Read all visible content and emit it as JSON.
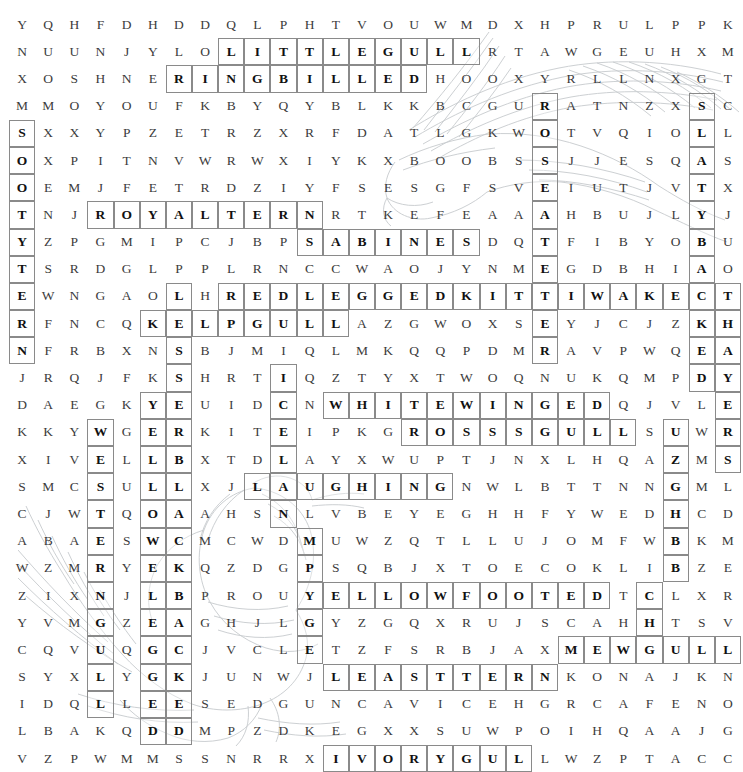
{
  "puzzle": {
    "type": "word-search",
    "theme": "gulls-and-terns",
    "rows": 26,
    "cols": 28,
    "grid": [
      "YQHFDHDDQLPHTVOUWMDXHPRULPPK",
      "NUUNJYLOLITTLEGULLRTAWGEUHXM",
      "XOSHNERINGBILLEDHOOXYRLLNXGT",
      "MMOYOUFKBYQYBLKKBCGURATNZXSC",
      "SXXYPZETRZXRFDATLGKWOTVQIOLL",
      "OXPITNVWRWXIYKXBOOBSSJJESQAS",
      "OEMJFETRDZIYFSESGFSVEIUTJVTX",
      "TNJROYALTERNRTKEFEAAAHBUJLYJ",
      "YZPGMIPCJBPSABINESDQTFIBYOBU",
      "TSRDGLPPLRNCCWAOJYNMEGDBHIAO",
      "EWNGAOLHREDLEGGEDKITTIWAKECT",
      "RFNCQKELPGULLAZGWOXSEYJCJZKH",
      "NFRBXNSBJMIQLMKQQPDMRAVPWQEA",
      "JRQJFKSHRTIQZTYXTWOQNUKQMPDY",
      "DAEGKYEUIDCNWHITEWINGEDQJVLE",
      "KKYWGERKITEIPKGROSSSGULLSUWR",
      "XIVELLBXTDLAYXWUPTJNXLHQAZMS",
      "SMCSULLXJLAUGHINGNWLBTTNNGML",
      "CJWTQOAAHSNLVBEYEGHHFYWEDHCD",
      "ABAESWCMCWDMUWZQTLLUJOMFWBKM",
      "WZMRYEKQZDGPSQBJXTOECOKLIBZE",
      "ZIXNJLBPROUYELLOWFOOTEDTCLXR",
      "YVMGZEAGHJLGYZGQXRUJSCAHHTSV",
      "CQVUQGCJVCLETZFSRBJAXMEWGULL",
      "SYXLYGKJUNWJLEASTTERNKONAJKN",
      "IDQLLEESEDGUNCAVICEHGRCAFENO",
      "LBAKQDDMPZDKEGXXSUWPOIHQAAJG",
      "VZPWMMSSNRRXIVORYGULLWZPTACC"
    ],
    "found_words": [
      {
        "text": "LITTLE GULL",
        "row": 2,
        "col": 9,
        "dir": "across",
        "len": 10
      },
      {
        "text": "RING BILLED",
        "row": 3,
        "col": 7,
        "dir": "across",
        "len": 10
      },
      {
        "text": "SOOTY TERN",
        "row": 5,
        "col": 1,
        "dir": "down",
        "len": 9
      },
      {
        "text": "ROYAL TERN",
        "row": 8,
        "col": 4,
        "dir": "across",
        "len": 9
      },
      {
        "text": "SABINES",
        "row": 9,
        "col": 12,
        "dir": "across",
        "len": 7
      },
      {
        "text": "RED LEGGED KITTIWAKE",
        "row": 11,
        "col": 9,
        "dir": "across",
        "len": 18
      },
      {
        "text": "KELP GULL",
        "row": 12,
        "col": 6,
        "dir": "across",
        "len": 8
      },
      {
        "text": "ICELAND",
        "row": 14,
        "col": 11,
        "dir": "down",
        "len": 8
      },
      {
        "text": "WHITE WINGED",
        "row": 15,
        "col": 13,
        "dir": "across",
        "len": 11
      },
      {
        "text": "WESTERN",
        "row": 16,
        "col": 4,
        "dir": "down",
        "len": 7
      },
      {
        "text": "ROSS S GULL",
        "row": 16,
        "col": 16,
        "dir": "across",
        "len": 9
      },
      {
        "text": "YELLOW FOOTED",
        "row": 22,
        "col": 12,
        "dir": "across",
        "len": 12
      },
      {
        "text": "LAUGHING",
        "row": 18,
        "col": 10,
        "dir": "across",
        "len": 8
      },
      {
        "text": "SANDWICH",
        "row": 16,
        "col": 26,
        "dir": "down",
        "len": 8
      },
      {
        "text": "SLATY BACKED",
        "row": 4,
        "col": 27,
        "dir": "down",
        "len": 11
      },
      {
        "text": "THAYERS",
        "row": 11,
        "col": 28,
        "dir": "down",
        "len": 7
      },
      {
        "text": "MEW GULL",
        "row": 24,
        "col": 22,
        "dir": "across",
        "len": 7
      },
      {
        "text": "LEAST TERN",
        "row": 25,
        "col": 13,
        "dir": "across",
        "len": 9
      },
      {
        "text": "IVORY GULL",
        "row": 28,
        "col": 13,
        "dir": "across",
        "len": 9
      },
      {
        "text": "GLAUCOUS",
        "row": 19,
        "col": 7,
        "dir": "down",
        "len": 8
      },
      {
        "text": "BLACK",
        "row": 18,
        "col": 8,
        "dir": "down",
        "len": 9
      }
    ],
    "highlighted_cells": [
      [
        2,
        9
      ],
      [
        2,
        10
      ],
      [
        2,
        11
      ],
      [
        2,
        12
      ],
      [
        2,
        13
      ],
      [
        2,
        14
      ],
      [
        2,
        15
      ],
      [
        2,
        16
      ],
      [
        2,
        17
      ],
      [
        2,
        18
      ],
      [
        3,
        7
      ],
      [
        3,
        8
      ],
      [
        3,
        9
      ],
      [
        3,
        10
      ],
      [
        3,
        11
      ],
      [
        3,
        12
      ],
      [
        3,
        13
      ],
      [
        3,
        14
      ],
      [
        3,
        15
      ],
      [
        3,
        16
      ],
      [
        4,
        21
      ],
      [
        4,
        27
      ],
      [
        5,
        1
      ],
      [
        5,
        21
      ],
      [
        5,
        27
      ],
      [
        6,
        1
      ],
      [
        6,
        21
      ],
      [
        6,
        27
      ],
      [
        7,
        1
      ],
      [
        7,
        21
      ],
      [
        7,
        27
      ],
      [
        8,
        1
      ],
      [
        8,
        4
      ],
      [
        8,
        5
      ],
      [
        8,
        6
      ],
      [
        8,
        7
      ],
      [
        8,
        8
      ],
      [
        8,
        9
      ],
      [
        8,
        10
      ],
      [
        8,
        11
      ],
      [
        8,
        12
      ],
      [
        8,
        21
      ],
      [
        8,
        27
      ],
      [
        9,
        1
      ],
      [
        9,
        12
      ],
      [
        9,
        13
      ],
      [
        9,
        14
      ],
      [
        9,
        15
      ],
      [
        9,
        16
      ],
      [
        9,
        17
      ],
      [
        9,
        18
      ],
      [
        9,
        21
      ],
      [
        9,
        27
      ],
      [
        10,
        1
      ],
      [
        10,
        21
      ],
      [
        10,
        27
      ],
      [
        11,
        1
      ],
      [
        11,
        7
      ],
      [
        11,
        9
      ],
      [
        11,
        10
      ],
      [
        11,
        11
      ],
      [
        11,
        12
      ],
      [
        11,
        13
      ],
      [
        11,
        14
      ],
      [
        11,
        15
      ],
      [
        11,
        16
      ],
      [
        11,
        17
      ],
      [
        11,
        18
      ],
      [
        11,
        19
      ],
      [
        11,
        20
      ],
      [
        11,
        21
      ],
      [
        11,
        22
      ],
      [
        11,
        23
      ],
      [
        11,
        24
      ],
      [
        11,
        25
      ],
      [
        11,
        26
      ],
      [
        11,
        27
      ],
      [
        11,
        28
      ],
      [
        12,
        1
      ],
      [
        12,
        6
      ],
      [
        12,
        7
      ],
      [
        12,
        8
      ],
      [
        12,
        9
      ],
      [
        12,
        10
      ],
      [
        12,
        11
      ],
      [
        12,
        12
      ],
      [
        12,
        13
      ],
      [
        12,
        21
      ],
      [
        12,
        27
      ],
      [
        12,
        28
      ],
      [
        13,
        1
      ],
      [
        13,
        7
      ],
      [
        13,
        21
      ],
      [
        13,
        27
      ],
      [
        13,
        28
      ],
      [
        14,
        7
      ],
      [
        14,
        11
      ],
      [
        14,
        27
      ],
      [
        14,
        28
      ],
      [
        15,
        6
      ],
      [
        15,
        7
      ],
      [
        15,
        11
      ],
      [
        15,
        13
      ],
      [
        15,
        14
      ],
      [
        15,
        15
      ],
      [
        15,
        16
      ],
      [
        15,
        17
      ],
      [
        15,
        18
      ],
      [
        15,
        19
      ],
      [
        15,
        20
      ],
      [
        15,
        21
      ],
      [
        15,
        22
      ],
      [
        15,
        23
      ],
      [
        15,
        28
      ],
      [
        16,
        4
      ],
      [
        16,
        6
      ],
      [
        16,
        7
      ],
      [
        16,
        11
      ],
      [
        16,
        16
      ],
      [
        16,
        17
      ],
      [
        16,
        18
      ],
      [
        16,
        19
      ],
      [
        16,
        20
      ],
      [
        16,
        21
      ],
      [
        16,
        22
      ],
      [
        16,
        23
      ],
      [
        16,
        24
      ],
      [
        16,
        26
      ],
      [
        16,
        28
      ],
      [
        17,
        4
      ],
      [
        17,
        6
      ],
      [
        17,
        7
      ],
      [
        17,
        11
      ],
      [
        17,
        26
      ],
      [
        17,
        28
      ],
      [
        18,
        4
      ],
      [
        18,
        6
      ],
      [
        18,
        7
      ],
      [
        18,
        10
      ],
      [
        18,
        11
      ],
      [
        18,
        12
      ],
      [
        18,
        13
      ],
      [
        18,
        14
      ],
      [
        18,
        15
      ],
      [
        18,
        16
      ],
      [
        18,
        17
      ],
      [
        18,
        26
      ],
      [
        19,
        4
      ],
      [
        19,
        6
      ],
      [
        19,
        7
      ],
      [
        19,
        11
      ],
      [
        19,
        26
      ],
      [
        20,
        4
      ],
      [
        20,
        6
      ],
      [
        20,
        7
      ],
      [
        20,
        12
      ],
      [
        20,
        26
      ],
      [
        21,
        4
      ],
      [
        21,
        6
      ],
      [
        21,
        7
      ],
      [
        21,
        12
      ],
      [
        21,
        26
      ],
      [
        22,
        4
      ],
      [
        22,
        6
      ],
      [
        22,
        7
      ],
      [
        22,
        12
      ],
      [
        22,
        13
      ],
      [
        22,
        14
      ],
      [
        22,
        15
      ],
      [
        22,
        16
      ],
      [
        22,
        17
      ],
      [
        22,
        18
      ],
      [
        22,
        19
      ],
      [
        22,
        20
      ],
      [
        22,
        21
      ],
      [
        22,
        22
      ],
      [
        22,
        23
      ],
      [
        22,
        25
      ],
      [
        23,
        4
      ],
      [
        23,
        6
      ],
      [
        23,
        7
      ],
      [
        23,
        12
      ],
      [
        23,
        25
      ],
      [
        24,
        4
      ],
      [
        24,
        6
      ],
      [
        24,
        7
      ],
      [
        24,
        12
      ],
      [
        24,
        22
      ],
      [
        24,
        23
      ],
      [
        24,
        24
      ],
      [
        24,
        25
      ],
      [
        24,
        26
      ],
      [
        24,
        27
      ],
      [
        24,
        28
      ],
      [
        25,
        4
      ],
      [
        25,
        6
      ],
      [
        25,
        7
      ],
      [
        25,
        13
      ],
      [
        25,
        14
      ],
      [
        25,
        15
      ],
      [
        25,
        16
      ],
      [
        25,
        17
      ],
      [
        25,
        18
      ],
      [
        25,
        19
      ],
      [
        25,
        20
      ],
      [
        25,
        21
      ],
      [
        26,
        4
      ],
      [
        26,
        6
      ],
      [
        26,
        7
      ],
      [
        27,
        6
      ],
      [
        27,
        7
      ],
      [
        28,
        13
      ],
      [
        28,
        14
      ],
      [
        28,
        15
      ],
      [
        28,
        16
      ],
      [
        28,
        17
      ],
      [
        28,
        18
      ],
      [
        28,
        19
      ],
      [
        28,
        20
      ]
    ]
  },
  "colors": {
    "letter": "#3c3c3c",
    "letter_highlighted": "#111111",
    "box_border": "#8a8a8a",
    "artwork_stroke": "#9aa0a6",
    "background": "#ffffff"
  }
}
